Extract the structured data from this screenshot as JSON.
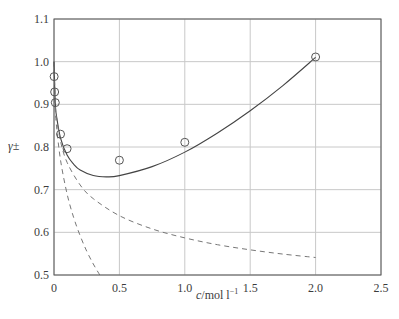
{
  "chart_data": {
    "type": "line",
    "title": "",
    "xlabel": "c/mol l⁻¹",
    "xlabel_italic": "c",
    "xlabel_rest": "/mol l",
    "xlabel_sup": "−1",
    "ylabel": "γ±",
    "xlim": [
      0,
      2.5
    ],
    "ylim": [
      0.5,
      1.1
    ],
    "xticks": [
      0,
      0.5,
      1.0,
      1.5,
      2.0,
      2.5
    ],
    "xtick_labels": [
      "0",
      "0.5",
      "1.0",
      "1.5",
      "2.0",
      "2.5"
    ],
    "yticks": [
      0.5,
      0.6,
      0.7,
      0.8,
      0.9,
      1.0,
      1.1
    ],
    "ytick_labels": [
      "0.5",
      "0.6",
      "0.7",
      "0.8",
      "0.9",
      "1.0",
      "1.1"
    ],
    "grid": true,
    "legend": null,
    "series": [
      {
        "name": "experimental",
        "style": "markers-open-circle",
        "x": [
          0.001,
          0.005,
          0.01,
          0.05,
          0.1,
          0.5,
          1.0,
          2.0
        ],
        "y": [
          0.965,
          0.929,
          0.904,
          0.83,
          0.796,
          0.769,
          0.811,
          1.011
        ]
      },
      {
        "name": "fitted (extended with linear term)",
        "style": "solid",
        "x": [
          0,
          0.01,
          0.02,
          0.05,
          0.1,
          0.15,
          0.2,
          0.3,
          0.4,
          0.5,
          0.75,
          1.0,
          1.25,
          1.5,
          1.75,
          2.0
        ],
        "y": [
          1.0,
          0.902,
          0.871,
          0.821,
          0.781,
          0.76,
          0.746,
          0.733,
          0.73,
          0.733,
          0.754,
          0.788,
          0.833,
          0.885,
          0.944,
          1.01
        ]
      },
      {
        "name": "extended Debye-Huckel",
        "style": "dashed",
        "x": [
          0,
          0.01,
          0.02,
          0.05,
          0.1,
          0.2,
          0.3,
          0.5,
          0.75,
          1.0,
          1.25,
          1.5,
          1.75,
          2.0
        ],
        "y": [
          1.0,
          0.901,
          0.868,
          0.813,
          0.764,
          0.711,
          0.679,
          0.639,
          0.608,
          0.587,
          0.571,
          0.559,
          0.549,
          0.541
        ]
      },
      {
        "name": "Debye-Huckel limiting law",
        "style": "dashed",
        "x": [
          0,
          0.01,
          0.02,
          0.05,
          0.1,
          0.15,
          0.2,
          0.25,
          0.3,
          0.35
        ],
        "y": [
          1.0,
          0.889,
          0.847,
          0.769,
          0.69,
          0.635,
          0.592,
          0.556,
          0.526,
          0.5
        ]
      }
    ]
  },
  "layout": {
    "plot_left": 54,
    "plot_right": 381,
    "plot_top": 19,
    "plot_bottom": 275
  }
}
